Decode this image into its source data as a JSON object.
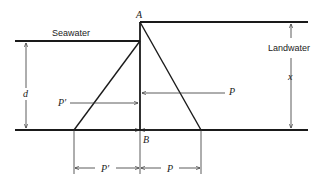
{
  "diagram": {
    "type": "Ghyben-Herzberg seawater/landwater pressure diagram",
    "labels": {
      "top_point": "A",
      "bottom_point": "B",
      "seawater": "Seawater",
      "landwater": "Landwater",
      "seawater_depth": "d",
      "landwater_height": "x",
      "pressure_sea": "P′",
      "pressure_land": "P",
      "dim_sea": "P′",
      "dim_land": "P"
    },
    "colors": {
      "line": "#1a1a1a",
      "background": "#ffffff"
    }
  }
}
